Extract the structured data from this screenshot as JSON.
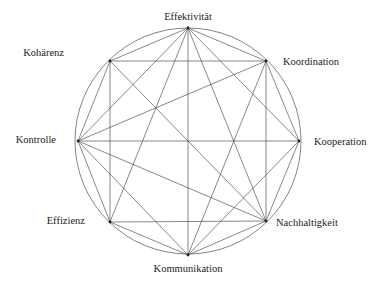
{
  "diagram": {
    "type": "complete-ish graph on circle",
    "circle": {
      "cx": 188,
      "cy": 141,
      "r": 113
    },
    "nodes": [
      {
        "id": "E",
        "label": "Effektivität",
        "x": 188,
        "y": 28,
        "lx": 188,
        "ly": 20,
        "anchor": "middle"
      },
      {
        "id": "Ko",
        "label": "Koordination",
        "x": 266,
        "y": 61,
        "lx": 283,
        "ly": 65,
        "anchor": "start"
      },
      {
        "id": "Kp",
        "label": "Kooperation",
        "x": 299,
        "y": 141,
        "lx": 314,
        "ly": 145,
        "anchor": "start"
      },
      {
        "id": "N",
        "label": "Nachhaltigkeit",
        "x": 266,
        "y": 221,
        "lx": 276,
        "ly": 226,
        "anchor": "start"
      },
      {
        "id": "Km",
        "label": "Kommunikation",
        "x": 188,
        "y": 255,
        "lx": 188,
        "ly": 272,
        "anchor": "middle"
      },
      {
        "id": "Ef",
        "label": "Effizienz",
        "x": 110,
        "y": 222,
        "lx": 85,
        "ly": 224,
        "anchor": "end"
      },
      {
        "id": "Kt",
        "label": "Kontrolle",
        "x": 78,
        "y": 141,
        "lx": 56,
        "ly": 143,
        "anchor": "end"
      },
      {
        "id": "Kh",
        "label": "Kohärenz",
        "x": 110,
        "y": 61,
        "lx": 64,
        "ly": 56,
        "anchor": "end"
      }
    ],
    "edges": [
      [
        "E",
        "Kh"
      ],
      [
        "E",
        "Ko"
      ],
      [
        "E",
        "Kt"
      ],
      [
        "E",
        "Ef"
      ],
      [
        "E",
        "Km"
      ],
      [
        "E",
        "N"
      ],
      [
        "E",
        "Kp"
      ],
      [
        "Kh",
        "Ko"
      ],
      [
        "Kh",
        "Kt"
      ],
      [
        "Kh",
        "Ef"
      ],
      [
        "Kh",
        "N"
      ],
      [
        "Ko",
        "Kt"
      ],
      [
        "Ko",
        "Km"
      ],
      [
        "Ko",
        "N"
      ],
      [
        "Ko",
        "Kp"
      ],
      [
        "Kp",
        "Kt"
      ],
      [
        "Kp",
        "N"
      ],
      [
        "Kp",
        "Km"
      ],
      [
        "N",
        "Km"
      ],
      [
        "N",
        "Ef"
      ],
      [
        "N",
        "Kt"
      ],
      [
        "Km",
        "Ef"
      ],
      [
        "Km",
        "Kt"
      ],
      [
        "Ef",
        "Kt"
      ]
    ]
  }
}
